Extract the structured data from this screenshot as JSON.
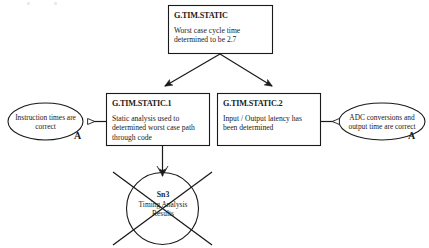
{
  "diagram": {
    "kind": "goal-structuring-notation",
    "title_text": "",
    "background_color": "#ffffff",
    "stroke_color": "#1a1a1a",
    "nodes": {
      "top_goal": {
        "id": "G.TIM.STATIC",
        "description": "Worst case cycle time determined to be 2.7",
        "shape": "rectangle"
      },
      "goal_1": {
        "id": "G.TIM.STATIC.1",
        "description": "Static analysis used to determined worst case path through code",
        "shape": "rectangle"
      },
      "goal_2": {
        "id": "G.TIM.STATIC.2",
        "description": "Input / Output latency has been determined",
        "shape": "rectangle"
      },
      "assumption_left": {
        "text": "Instruction times are correct",
        "shape": "ellipse",
        "marker": "A"
      },
      "assumption_right": {
        "text": "ADC conversions and output time are correct",
        "shape": "ellipse",
        "marker": "A"
      },
      "solution": {
        "id": "Sn3",
        "description_line_1": "Timing Analysis",
        "description_line_2": "Results",
        "shape": "circle",
        "struck_out": true
      }
    },
    "connectors": [
      {
        "name": "top-goal-to-goal-1",
        "arrow": "solid"
      },
      {
        "name": "top-goal-to-goal-2",
        "arrow": "solid"
      },
      {
        "name": "goal-1-to-assumption-left",
        "arrow": "hollow"
      },
      {
        "name": "goal-2-to-assumption-right",
        "arrow": "hollow"
      },
      {
        "name": "goal-1-to-solution",
        "arrow": "solid"
      }
    ]
  }
}
